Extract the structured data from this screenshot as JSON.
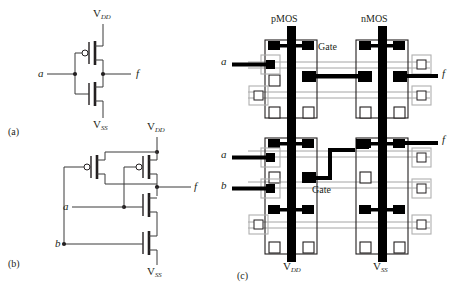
{
  "figure": {
    "caption_labels": {
      "a": "(a)",
      "b": "(b)",
      "c": "(c)"
    },
    "subfigure_a": {
      "title_role": "CMOS inverter schematic",
      "supply_top": "V",
      "supply_top_sub": "DD",
      "supply_bottom": "V",
      "supply_bottom_sub": "SS",
      "input": "a",
      "output": "f",
      "transistors": [
        {
          "type": "pMOS",
          "has_bubble": true
        },
        {
          "type": "nMOS",
          "has_bubble": false
        }
      ]
    },
    "subfigure_b": {
      "title_role": "Two-input CMOS NAND schematic",
      "supply_top": "V",
      "supply_top_sub": "DD",
      "supply_bottom": "V",
      "supply_bottom_sub": "SS",
      "inputs": [
        "a",
        "b"
      ],
      "output": "f",
      "transistors": [
        {
          "type": "pMOS",
          "has_bubble": true
        },
        {
          "type": "pMOS",
          "has_bubble": true
        },
        {
          "type": "nMOS",
          "has_bubble": false
        },
        {
          "type": "nMOS",
          "has_bubble": false
        }
      ]
    },
    "subfigure_c": {
      "title_role": "Mask layout / stick diagram",
      "column_headers": [
        "pMOS",
        "nMOS"
      ],
      "rail_labels": [
        {
          "text": "V",
          "sub": "DD"
        },
        {
          "text": "V",
          "sub": "SS"
        }
      ],
      "cells": [
        {
          "name": "inverter-layout",
          "gate_label": "Gate",
          "inputs": [
            "a"
          ],
          "outputs": [
            "f"
          ]
        },
        {
          "name": "nand-layout",
          "gate_label": "Gate",
          "inputs": [
            "a",
            "b"
          ],
          "outputs": [
            "f"
          ]
        }
      ]
    },
    "colors": {
      "ink": "#231f20",
      "wire": "#4a4a4a",
      "diffusion": "#9a9a9a",
      "contact_fill": "#000000",
      "contact_open": "#ffffff"
    }
  }
}
